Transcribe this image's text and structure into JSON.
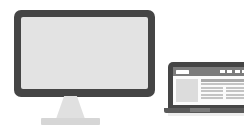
{
  "illustration": {
    "title": "Responsive devices illustration",
    "background_color": "#ffffff",
    "devices": [
      {
        "name": "desktop-monitor",
        "label": "Desktop monitor",
        "bezel_color": "#454545",
        "screen_color": "#e3e3e3",
        "stand_color": "#e0e0e0",
        "base_color": "#d6d6d6",
        "screen_content": "blank"
      },
      {
        "name": "laptop",
        "label": "Laptop",
        "bezel_color": "#454545",
        "screen_color": "#f2f2f2",
        "base_color": "#5a5a5a",
        "screen_content": "webpage-wireframe"
      }
    ]
  },
  "laptop_page": {
    "header": {
      "brand_label": "",
      "brand_color": "#ffffff",
      "bar_color": "#7c7c7c",
      "nav_items": [
        {
          "label": ""
        },
        {
          "label": ""
        },
        {
          "label": ""
        },
        {
          "label": ""
        }
      ]
    },
    "body": {
      "media_label": "",
      "media_color": "#dcdcdc",
      "text_color": "#c4c4c4",
      "heading_color": "#a9a9a9",
      "blocks": [
        {
          "type": "heading",
          "label": ""
        },
        {
          "type": "line",
          "label": ""
        },
        {
          "type": "row",
          "label": ""
        },
        {
          "type": "row",
          "label": ""
        },
        {
          "type": "row",
          "label": ""
        },
        {
          "type": "row",
          "label": ""
        }
      ]
    }
  }
}
